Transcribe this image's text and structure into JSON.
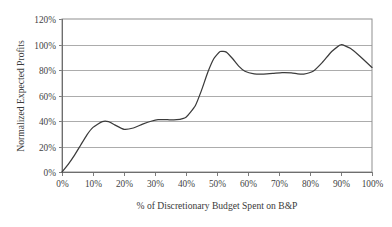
{
  "chart_data": {
    "type": "line",
    "title": "",
    "xlabel": "% of Discretionary Budget Spent on B&P",
    "ylabel": "Normalized Expected Profits",
    "xlim": [
      0,
      100
    ],
    "ylim": [
      0,
      120
    ],
    "grid": "horizontal",
    "legend": "none",
    "x_tick_labels": [
      "0%",
      "10%",
      "20%",
      "30%",
      "40%",
      "50%",
      "60%",
      "70%",
      "80%",
      "90%",
      "100%"
    ],
    "x_ticks": [
      0,
      10,
      20,
      30,
      40,
      50,
      60,
      70,
      80,
      90,
      100
    ],
    "y_tick_labels": [
      "0%",
      "20%",
      "40%",
      "60%",
      "80%",
      "100%",
      "120%"
    ],
    "y_ticks": [
      0,
      20,
      40,
      60,
      80,
      100,
      120
    ],
    "series": [
      {
        "name": "Normalized Expected Profits",
        "color": "#3b3b3b",
        "x": [
          0,
          2,
          4,
          6,
          8,
          10,
          13,
          15,
          17,
          20,
          23,
          26,
          29,
          31,
          34,
          37,
          40,
          43,
          45,
          47,
          49,
          51,
          53,
          55,
          57,
          59,
          62,
          65,
          68,
          71,
          74,
          76,
          78,
          81,
          84,
          87,
          90,
          93,
          96,
          100
        ],
        "y": [
          0,
          6,
          13,
          21,
          29,
          35,
          39.5,
          39.5,
          37,
          33.5,
          34.5,
          37.5,
          40,
          41,
          41,
          41,
          43,
          52,
          64,
          78,
          89,
          94.5,
          94,
          89,
          83,
          79,
          77,
          76.8,
          77.3,
          78,
          77.8,
          77,
          76.8,
          79,
          86,
          94.5,
          99.8,
          97,
          91,
          82
        ]
      }
    ]
  },
  "axes": {
    "y_title": "Normalized Expected Profits",
    "x_title": "% of Discretionary Budget Spent on B&P"
  }
}
